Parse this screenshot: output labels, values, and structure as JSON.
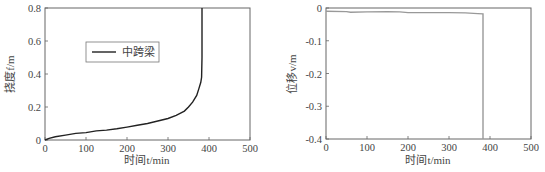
{
  "chart_data": [
    {
      "type": "line",
      "title": "",
      "xlabel": "时间t/min",
      "ylabel": "挠度f/m",
      "xlim": [
        0,
        500
      ],
      "ylim": [
        0,
        0.8
      ],
      "xticks": [
        "0",
        "100",
        "200",
        "300",
        "400",
        "500"
      ],
      "yticks": [
        "0",
        "0.2",
        "0.4",
        "0.6",
        "0.8"
      ],
      "grid": false,
      "legend": {
        "position": "upper-left-center",
        "entries": [
          "中跨梁"
        ]
      },
      "series": [
        {
          "name": "中跨梁",
          "color": "#222222",
          "x": [
            0,
            10,
            25,
            50,
            75,
            100,
            125,
            150,
            175,
            200,
            225,
            250,
            275,
            300,
            320,
            340,
            350,
            360,
            370,
            375,
            380,
            382,
            383,
            383
          ],
          "y": [
            0,
            0.01,
            0.02,
            0.03,
            0.04,
            0.045,
            0.055,
            0.06,
            0.068,
            0.078,
            0.09,
            0.1,
            0.115,
            0.13,
            0.15,
            0.175,
            0.2,
            0.23,
            0.27,
            0.31,
            0.35,
            0.38,
            0.5,
            0.8
          ]
        }
      ]
    },
    {
      "type": "line",
      "title": "",
      "xlabel": "时间t/min",
      "ylabel": "位移v/m",
      "xlim": [
        0,
        500
      ],
      "ylim": [
        -0.4,
        0
      ],
      "xticks": [
        "0",
        "100",
        "200",
        "300",
        "400",
        "500"
      ],
      "yticks": [
        "0",
        "-0.1",
        "-0.2",
        "-0.3",
        "-0.4"
      ],
      "grid": false,
      "legend": null,
      "series": [
        {
          "name": "位移",
          "color": "#999999",
          "x": [
            0,
            50,
            60,
            100,
            150,
            180,
            200,
            250,
            300,
            340,
            370,
            383,
            383
          ],
          "y": [
            -0.01,
            -0.011,
            -0.013,
            -0.012,
            -0.011,
            -0.012,
            -0.014,
            -0.014,
            -0.014,
            -0.015,
            -0.017,
            -0.018,
            -0.4
          ]
        }
      ]
    }
  ]
}
